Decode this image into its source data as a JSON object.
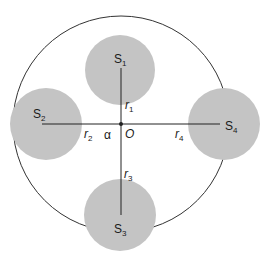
{
  "diagram": {
    "colors": {
      "disk_fill": "#c4c4c4",
      "line": "#222222",
      "outer_circle": "#333333",
      "background": "#ffffff"
    },
    "outer_circle": {
      "cx": 121,
      "cy": 124,
      "r": 108
    },
    "center": {
      "label": "O",
      "x": 121,
      "y": 124
    },
    "angle_label": "α",
    "disks": [
      {
        "id": "S1",
        "base": "S",
        "sub": "1",
        "cx": 120,
        "cy": 70,
        "r": 35,
        "label_x": 114,
        "label_y": 63
      },
      {
        "id": "S2",
        "base": "S",
        "sub": "2",
        "cx": 46,
        "cy": 124,
        "r": 36,
        "label_x": 33,
        "label_y": 118
      },
      {
        "id": "S3",
        "base": "S",
        "sub": "3",
        "cx": 120,
        "cy": 215,
        "r": 36,
        "label_x": 114,
        "label_y": 233
      },
      {
        "id": "S4",
        "base": "S",
        "sub": "4",
        "cx": 224,
        "cy": 124,
        "r": 36,
        "label_x": 225,
        "label_y": 130
      }
    ],
    "radii": [
      {
        "id": "r1",
        "base": "r",
        "sub": "1",
        "x": 125,
        "y": 109
      },
      {
        "id": "r2",
        "base": "r",
        "sub": "2",
        "x": 84,
        "y": 138
      },
      {
        "id": "r3",
        "base": "r",
        "sub": "3",
        "x": 124,
        "y": 178
      },
      {
        "id": "r4",
        "base": "r",
        "sub": "4",
        "x": 175,
        "y": 138
      }
    ],
    "lines": {
      "vertical": {
        "x": 121,
        "y1": 68,
        "y2": 215
      },
      "horizontal": {
        "y": 124,
        "x1": 42,
        "x2": 220
      }
    }
  }
}
